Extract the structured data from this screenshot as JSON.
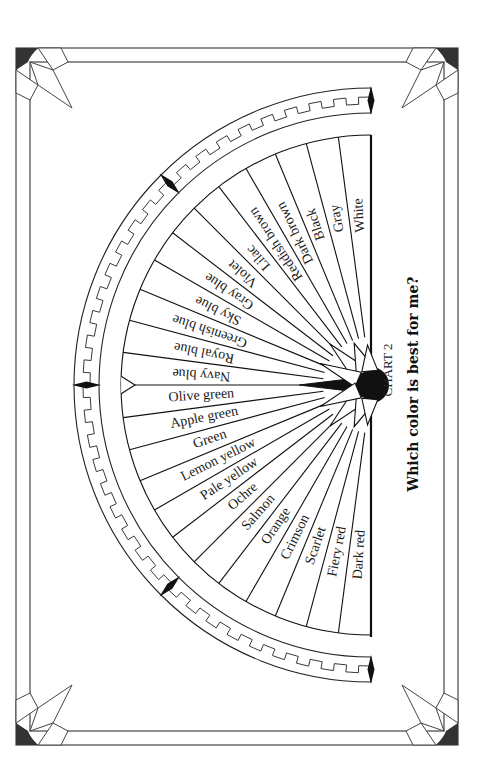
{
  "chart": {
    "number_label": "CHART 2",
    "title": "Which color is best for me?",
    "wedges": [
      "White",
      "Gray",
      "Black",
      "Dark brown",
      "Reddish brown",
      "Lilac",
      "Violet",
      "Gray blue",
      "Sky blue",
      "Greenish blue",
      "Royal blue",
      "Navy blue",
      "Olive green",
      "Apple green",
      "Green",
      "Lemon yellow",
      "Pale yellow",
      "Ochre",
      "Salmon",
      "Orange",
      "Crimson",
      "Scarlet",
      "Fiery red",
      "Dark red"
    ]
  },
  "colors": {
    "ink": "#111111",
    "paper": "#ffffff",
    "corner_fill": "#333333"
  }
}
